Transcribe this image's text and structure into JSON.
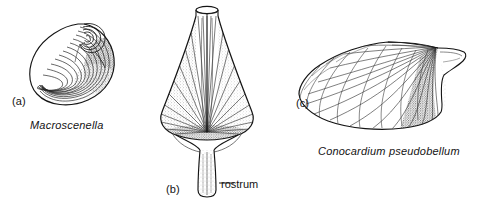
{
  "figure": {
    "background_color": "#ffffff",
    "ink_color": "#141414",
    "width": 488,
    "height": 203
  },
  "panels": [
    {
      "letter": "(a)",
      "taxon": "Macroscenella",
      "shape": "coiled-spiral-shell"
    },
    {
      "letter": "(b)",
      "taxon": "",
      "shape": "conical-rostroconch-shell"
    },
    {
      "letter": "(c)",
      "taxon": "Conocardium pseudobellum",
      "shape": "fan-shaped-rostroconch-shell"
    }
  ],
  "annotations": [
    {
      "label": "rostrum",
      "target_panel": "(b)"
    }
  ]
}
